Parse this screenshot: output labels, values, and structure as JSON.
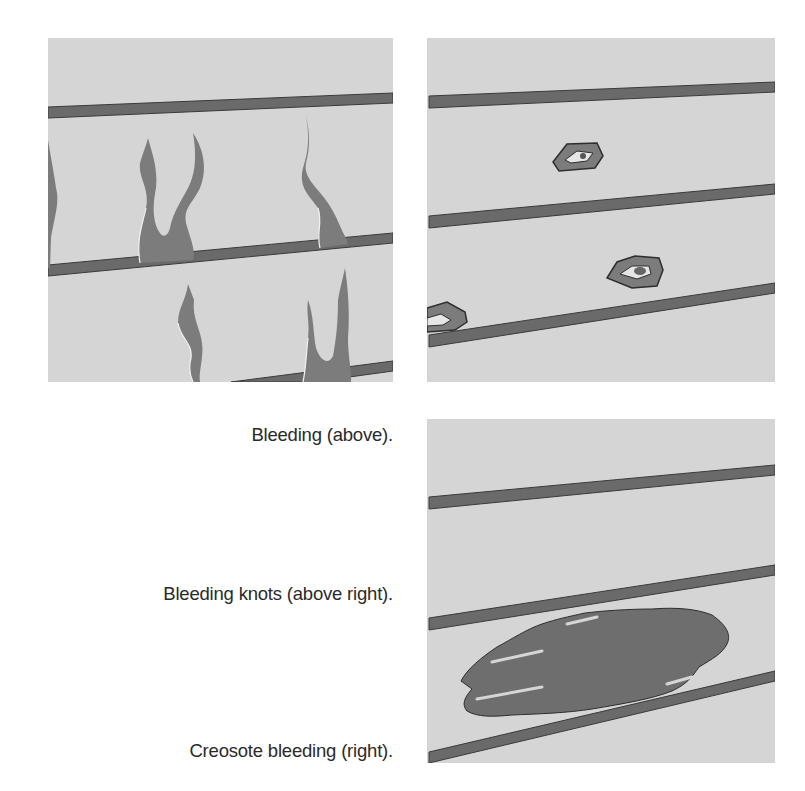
{
  "figure": {
    "panels": [
      {
        "id": "bleeding",
        "description": "Wood siding boards with flame-shaped dark stains rising from lap joints",
        "background_color": "#d5d5d5",
        "stain_color": "#7a7a7a",
        "board_line_color": "#5e5e5e"
      },
      {
        "id": "bleeding-knots",
        "description": "Wood siding boards with ring-shaped stains around knots",
        "background_color": "#d5d5d5",
        "stain_color": "#7a7a7a",
        "board_line_color": "#5e5e5e"
      },
      {
        "id": "creosote-bleeding",
        "description": "Wood siding boards with a large dark creosote stain",
        "background_color": "#d5d5d5",
        "stain_color": "#6e6e6e",
        "board_line_color": "#5e5e5e"
      }
    ],
    "captions": [
      "Bleeding (above).",
      "Bleeding knots (above right).",
      "Creosote bleeding (right)."
    ]
  }
}
